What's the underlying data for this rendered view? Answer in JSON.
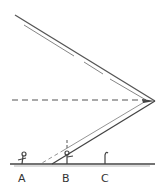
{
  "diagram": {
    "title": "",
    "labels": {
      "a": "A",
      "b": "B",
      "c": "C",
      "mark": "!"
    },
    "colors": {
      "line": "#555555",
      "background": "#ffffff"
    }
  }
}
